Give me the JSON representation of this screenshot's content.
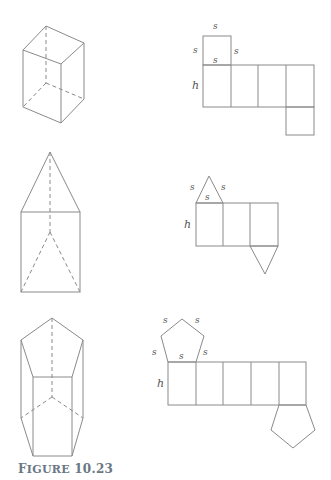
{
  "caption": {
    "prefix": "F",
    "word": "IGURE",
    "number": "10.23"
  },
  "labels": {
    "side": "s",
    "height": "h"
  },
  "figures": [
    {
      "name": "square-prism",
      "net": "square-prism-net"
    },
    {
      "name": "triangular-prism",
      "net": "triangular-prism-net"
    },
    {
      "name": "pentagonal-prism",
      "net": "pentagonal-prism-net"
    }
  ],
  "colors": {
    "line": "#8a8a8a",
    "caption": "#6b7784"
  }
}
